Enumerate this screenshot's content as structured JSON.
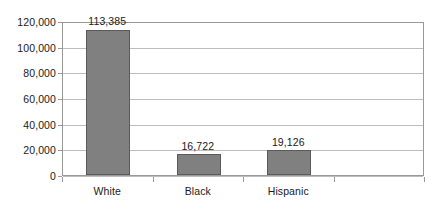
{
  "chart_data": {
    "type": "bar",
    "title": "",
    "subtitle": "",
    "xlabel": "",
    "ylabel": "",
    "categories": [
      "White",
      "Black",
      "Hispanic",
      ""
    ],
    "values": [
      113385,
      16722,
      19126,
      null
    ],
    "value_labels": [
      "113,385",
      "16,722",
      "19,126",
      ""
    ],
    "ylim": [
      0,
      120000
    ],
    "yticks": [
      0,
      20000,
      40000,
      60000,
      80000,
      100000,
      120000
    ],
    "ytick_labels": [
      "0",
      "20,000",
      "40,000",
      "60,000",
      "80,000",
      "100,000",
      "120,000"
    ],
    "grid": true,
    "grid_axis": "y",
    "legend": false,
    "legend_position": "none",
    "bar_color": "#808080",
    "bar_border_color": "#5a5a5a",
    "gridline_color": "#bdbdbd",
    "axis_color": "#9a9a9a",
    "text_color": "#1a1a1a",
    "background_color": "#ffffff",
    "data_labels_shown": true
  }
}
